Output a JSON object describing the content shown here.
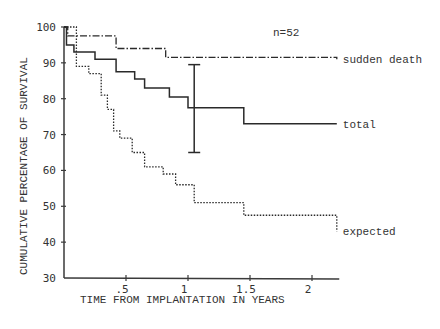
{
  "chart_data": {
    "type": "line",
    "subtype": "step (Kaplan-Meier survival curves)",
    "title": "",
    "annotation": "n=52",
    "xlabel": "TIME FROM IMPLANTATION IN YEARS",
    "ylabel": "CUMULATIVE PERCENTAGE OF SURVIVAL",
    "xlim": [
      0,
      2.2
    ],
    "ylim": [
      30,
      100
    ],
    "xticks": [
      0.5,
      1,
      1.5,
      2
    ],
    "xtick_labels": [
      ".5",
      "1",
      "1.5",
      "2"
    ],
    "yticks": [
      30,
      40,
      50,
      60,
      70,
      80,
      90,
      100
    ],
    "ytick_labels": [
      "30",
      "40",
      "50",
      "60",
      "70",
      "80",
      "90",
      "100"
    ],
    "grid": false,
    "legend": "inline labels at line ends",
    "series": [
      {
        "name": "sudden death",
        "style": "dash-dot",
        "x": [
          0,
          0.03,
          0.42,
          0.82,
          2.2
        ],
        "y": [
          100,
          97.5,
          94,
          91.5,
          91
        ]
      },
      {
        "name": "total",
        "style": "solid",
        "x": [
          0,
          0.02,
          0.08,
          0.25,
          0.42,
          0.57,
          0.65,
          0.85,
          1.0,
          1.45,
          2.2
        ],
        "y": [
          100,
          95,
          93,
          91,
          87.5,
          85.5,
          83,
          80.5,
          77.5,
          73,
          73
        ],
        "error_bar": {
          "x": 1.05,
          "low": 65,
          "high": 89.5
        }
      },
      {
        "name": "expected",
        "style": "dotted",
        "x": [
          0,
          0.1,
          0.2,
          0.3,
          0.35,
          0.4,
          0.45,
          0.55,
          0.65,
          0.8,
          0.9,
          1.05,
          1.45,
          2.2
        ],
        "y": [
          100,
          89,
          87,
          81,
          77,
          71,
          69,
          65,
          61,
          59,
          56,
          51,
          47.5,
          43
        ]
      }
    ]
  }
}
